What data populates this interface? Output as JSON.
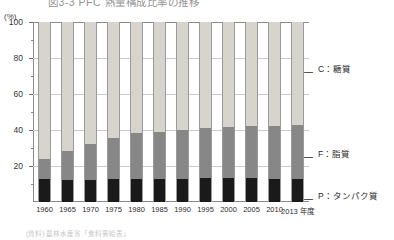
{
  "figure": {
    "title": "図3-3 PFC 熱量構成比率の推移",
    "unit_label": "(%)",
    "source_note": "(資料) 農林水産省「食料需給表」"
  },
  "axis": {
    "y_ticks": [
      "100",
      "80",
      "60",
      "40",
      "20"
    ],
    "y_tick_values": [
      100,
      80,
      60,
      40,
      20
    ],
    "y_minor_values": [
      90,
      70,
      50,
      30,
      10
    ]
  },
  "legend": [
    {
      "key": "C",
      "label": "C：糖質",
      "color": "#d6d4cd"
    },
    {
      "key": "F",
      "label": "F：脂質",
      "color": "#878787"
    },
    {
      "key": "P",
      "label": "P：タンパク質",
      "color": "#1a1a1a"
    }
  ],
  "chart_data": {
    "type": "bar",
    "stacked": true,
    "stack_total": 100,
    "title": "図3-3 PFC 熱量構成比率の推移",
    "xlabel": "",
    "ylabel": "(%)",
    "ylim": [
      0,
      100
    ],
    "grid": true,
    "legend_position": "right",
    "categories": [
      "1960",
      "1965",
      "1970",
      "1975",
      "1980",
      "1985",
      "1990",
      "1995",
      "2000",
      "2005",
      "2010",
      "2013 年度"
    ],
    "series": [
      {
        "name": "P：タンパク質",
        "color": "#1a1a1a",
        "values": [
          13.0,
          12.2,
          12.4,
          12.7,
          13.0,
          12.7,
          12.9,
          13.3,
          13.1,
          13.1,
          13.0,
          13.0
        ]
      },
      {
        "name": "F：脂質",
        "color": "#878787",
        "values": [
          11.0,
          16.2,
          20.0,
          22.8,
          25.5,
          26.1,
          27.3,
          27.9,
          28.5,
          28.9,
          29.0,
          30.0
        ]
      },
      {
        "name": "C：糖質",
        "color": "#d6d4cd",
        "values": [
          76.0,
          71.6,
          67.6,
          64.5,
          61.5,
          61.2,
          59.8,
          58.8,
          58.4,
          58.0,
          58.0,
          57.0
        ]
      }
    ],
    "annotations": [
      "C：糖質 の構成比は1960年から低下を続けている",
      "F：脂質 の構成比は1960年から上昇を続けている"
    ]
  }
}
